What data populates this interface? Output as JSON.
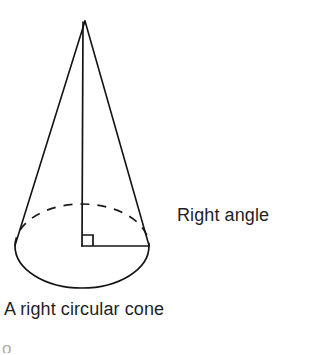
{
  "figure": {
    "kind": "geometry-diagram",
    "subject": "right circular cone",
    "caption": "A right circular cone",
    "annotation": "Right angle",
    "clipped_glyph": "o",
    "colors": {
      "background": "#ffffff",
      "stroke": "#141414",
      "text": "#1f1f1f"
    },
    "geometry": {
      "apex": {
        "x": 85,
        "y": 20
      },
      "base_center": {
        "x": 82,
        "y": 246
      },
      "base_rx": 67,
      "base_ry": 42,
      "base_left": {
        "x": 15,
        "y": 246
      },
      "base_right": {
        "x": 149,
        "y": 246
      },
      "axis_x": 82,
      "axis_top_y": 22,
      "axis_bottom_y": 246,
      "radius_line": {
        "x1": 82,
        "y1": 246,
        "x2": 149,
        "y2": 246
      },
      "right_angle_marker_size": 11,
      "stroke_width": 1.6,
      "dash_pattern": "9 7"
    }
  },
  "labels": {
    "right_angle": "Right angle",
    "caption": "A right circular cone"
  }
}
